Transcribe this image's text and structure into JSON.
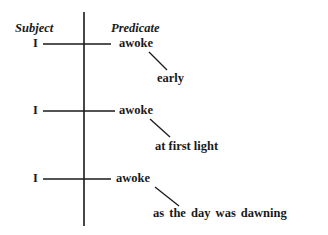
{
  "headers": {
    "subject": "Subject",
    "predicate": "Predicate"
  },
  "rows": [
    {
      "subject": "I",
      "verb": "awoke",
      "modifier": "early"
    },
    {
      "subject": "I",
      "verb": "awoke",
      "modifier": "at first light"
    },
    {
      "subject": "I",
      "verb": "awoke",
      "modifier": "as the day was dawning"
    }
  ],
  "colors": {
    "ink": "#1a1a1a",
    "background": "#ffffff"
  }
}
